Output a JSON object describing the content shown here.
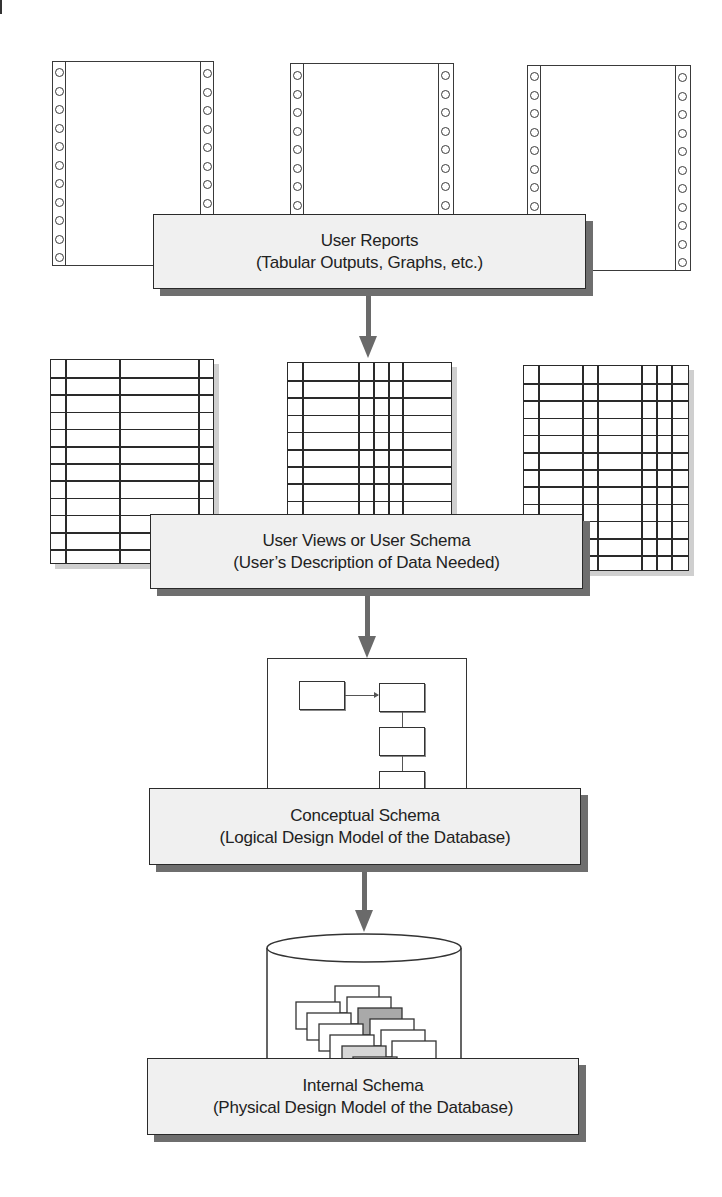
{
  "diagram": {
    "type": "database-schema-levels",
    "levels": [
      {
        "id": "user-reports",
        "title": "User Reports",
        "subtitle": "(Tabular Outputs, Graphs, etc.)",
        "illustration": "three continuous-feed printer pages"
      },
      {
        "id": "user-views",
        "title": "User Views or User Schema",
        "subtitle": "(User’s Description of Data Needed)",
        "illustration": "three ruled tables"
      },
      {
        "id": "conceptual-schema",
        "title": "Conceptual Schema",
        "subtitle": "(Logical Design Model of the Database)",
        "illustration": "entity box diagram"
      },
      {
        "id": "internal-schema",
        "title": "Internal Schema",
        "subtitle": "(Physical Design Model of the Database)",
        "illustration": "database cylinder with stacked records"
      }
    ],
    "arrows": [
      {
        "from": "user-reports",
        "to": "user-views"
      },
      {
        "from": "user-views",
        "to": "conceptual-schema"
      },
      {
        "from": "conceptual-schema",
        "to": "internal-schema"
      }
    ]
  },
  "colors": {
    "box_fill": "#f0f0f0",
    "box_border": "#2a2a2a",
    "box_shadow": "#6e6e6e",
    "arrow": "#6a6a6a",
    "line": "#2a2a2a",
    "highlight_card_dark": "#a9a9a9",
    "highlight_card_light": "#d6d6d6"
  }
}
